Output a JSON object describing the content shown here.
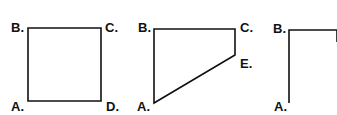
{
  "diagram": {
    "stroke_color": "#111111",
    "background": "#ffffff",
    "figures": [
      {
        "name": "square",
        "labels": {
          "A": "A.",
          "B": "B.",
          "C": "C.",
          "D": "D."
        },
        "points": "28,28 101,28 101,101 28,101"
      },
      {
        "name": "trapezoid",
        "labels": {
          "A": "A.",
          "B": "B.",
          "C": "C.",
          "E": "E."
        },
        "points": "154,29 235,29 235,55 154,103"
      },
      {
        "name": "triangle",
        "labels": {
          "A": "A.",
          "B": "B."
        },
        "points": "289,103 289,30 337,30 337,42"
      }
    ]
  }
}
